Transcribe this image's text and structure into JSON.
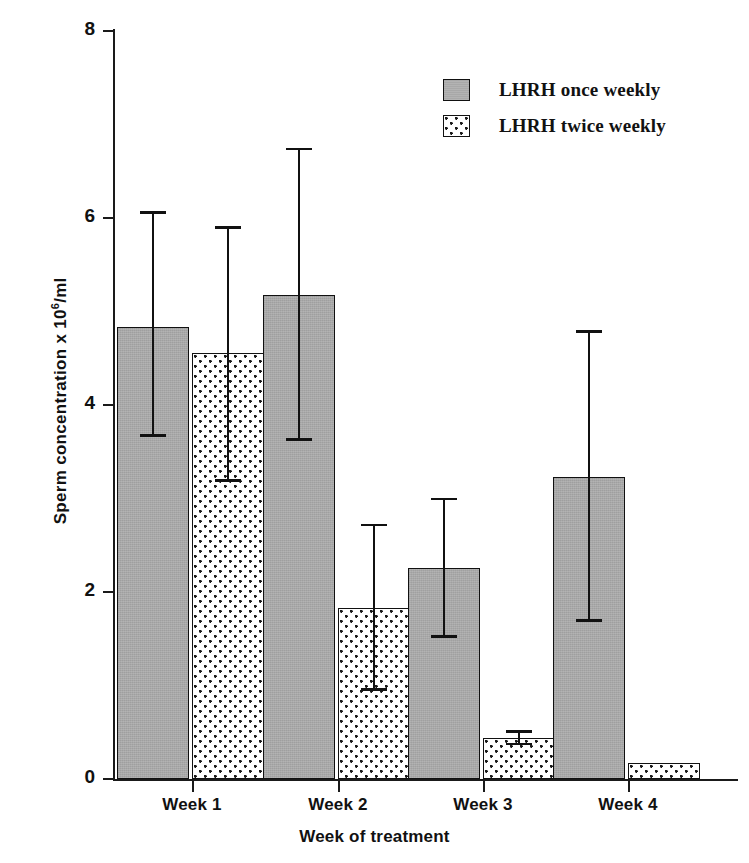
{
  "chart_data": {
    "type": "bar",
    "title": "",
    "xlabel": "Week of treatment",
    "ylabel": "Sperm concentration  x  10⁶/ml",
    "ylabel_parts": {
      "pre": "Sperm concentration  x  10",
      "sup": "6",
      "post": "/ml"
    },
    "categories": [
      "Week 1",
      "Week 2",
      "Week 3",
      "Week 4"
    ],
    "ylim": [
      0,
      8
    ],
    "yticks": [
      0,
      2,
      4,
      6,
      8
    ],
    "ytick_labels": [
      "0",
      "2",
      "4",
      "6",
      "8"
    ],
    "grid": false,
    "legend_position": "top-right",
    "series": [
      {
        "name": "LHRH once weekly",
        "fill": "solid-gray",
        "color": "#a8a8a8",
        "values": [
          4.83,
          5.18,
          2.26,
          3.23
        ],
        "error_upper": [
          6.07,
          6.75,
          3.01,
          4.8
        ],
        "error_lower": [
          3.66,
          3.62,
          1.51,
          1.68
        ]
      },
      {
        "name": "LHRH twice weekly",
        "fill": "dotted",
        "color": "#ffffff",
        "values": [
          4.56,
          1.83,
          0.44,
          0.17
        ],
        "error_upper": [
          5.91,
          2.73,
          0.52,
          null
        ],
        "error_lower": [
          3.18,
          0.94,
          0.36,
          null
        ]
      }
    ]
  },
  "legend": {
    "items": [
      {
        "label": "LHRH once weekly",
        "swatch": "solid"
      },
      {
        "label": "LHRH twice weekly",
        "swatch": "dotted"
      }
    ]
  },
  "axes": {
    "y_title_pre": "Sperm concentration  x  10",
    "y_title_sup": "6",
    "y_title_post": "/ml",
    "x_title": "Week of treatment"
  },
  "colors": {
    "ink": "#1a1a1a",
    "series_once": "#a8a8a8",
    "series_twice": "#ffffff",
    "background": "#ffffff"
  }
}
